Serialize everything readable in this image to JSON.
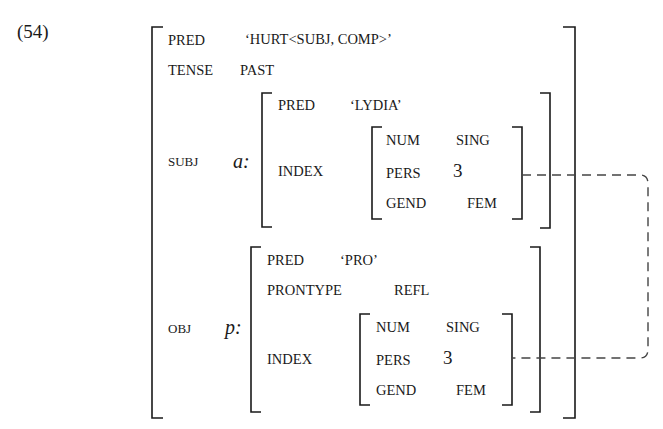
{
  "example_number": "(54)",
  "fstructure": {
    "pred": {
      "attr": "PRED",
      "value": "‘HURT<SUBJ, COMP>’"
    },
    "tense": {
      "attr": "TENSE",
      "value": "PAST"
    },
    "subj": {
      "attr": "SUBJ",
      "label": "a:",
      "pred": {
        "attr": "PRED",
        "value": "‘LYDIA’"
      },
      "index": {
        "attr": "INDEX",
        "num": {
          "attr": "NUM",
          "value": "SING"
        },
        "pers": {
          "attr": "PERS",
          "value": "3"
        },
        "gend": {
          "attr": "GEND",
          "value": "FEM"
        }
      }
    },
    "obj": {
      "attr": "OBJ",
      "label": "p:",
      "pred": {
        "attr": "PRED",
        "value": "‘PRO’"
      },
      "prontype": {
        "attr": "PRONTYPE",
        "value": "REFL"
      },
      "index": {
        "attr": "INDEX",
        "num": {
          "attr": "NUM",
          "value": "SING"
        },
        "pers": {
          "attr": "PERS",
          "value": "3"
        },
        "gend": {
          "attr": "GEND",
          "value": "FEM"
        }
      }
    }
  },
  "colors": {
    "ink": "#1a1a1a",
    "dash": "#444444"
  }
}
